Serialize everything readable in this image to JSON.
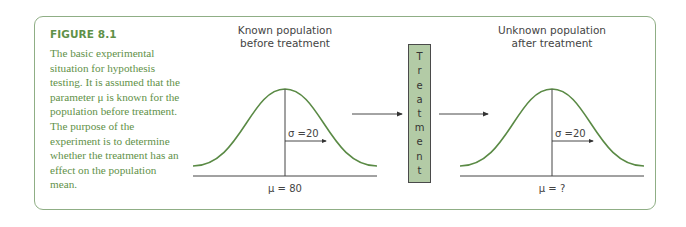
{
  "figure": {
    "title": "FIGURE 8.1",
    "caption": "The basic experimental situation for hypothesis testing. It is assumed that the parameter μ is known for the population before treatment. The purpose of the experiment is to determine whether the treatment has an effect on the population mean."
  },
  "left_panel": {
    "title_line1": "Known population",
    "title_line2": "before treatment",
    "sigma_label": "σ =20",
    "mu_label": "μ = 80"
  },
  "treatment": {
    "letters": [
      "T",
      "r",
      "e",
      "a",
      "t",
      "m",
      "e",
      "n",
      "t"
    ]
  },
  "right_panel": {
    "title_line1": "Unknown population",
    "title_line2": "after treatment",
    "sigma_label": "σ =20",
    "mu_label": "μ = ?"
  },
  "colors": {
    "frame": "#8fae85",
    "caption_text": "#5f9148",
    "curve": "#5a8a45",
    "treatment_fill": "#b3cba6"
  }
}
